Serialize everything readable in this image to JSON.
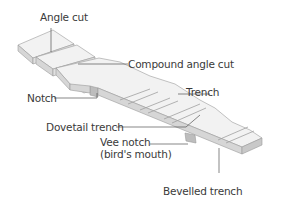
{
  "diagram": {
    "colors": {
      "top_face": "#f2f2f2",
      "side_face": "#d6d6d6",
      "end_face": "#bdbdbd",
      "outline": "#9a9a9a",
      "leader": "#555555",
      "text": "#3a3a3a"
    },
    "labels": {
      "angle_cut": "Angle cut",
      "compound_angle_cut": "Compound angle cut",
      "notch": "Notch",
      "trench": "Trench",
      "dovetail_trench": "Dovetail trench",
      "vee_notch_line1": "Vee notch",
      "vee_notch_line2": "(bird's mouth)",
      "bevelled_trench": "Bevelled trench"
    }
  }
}
